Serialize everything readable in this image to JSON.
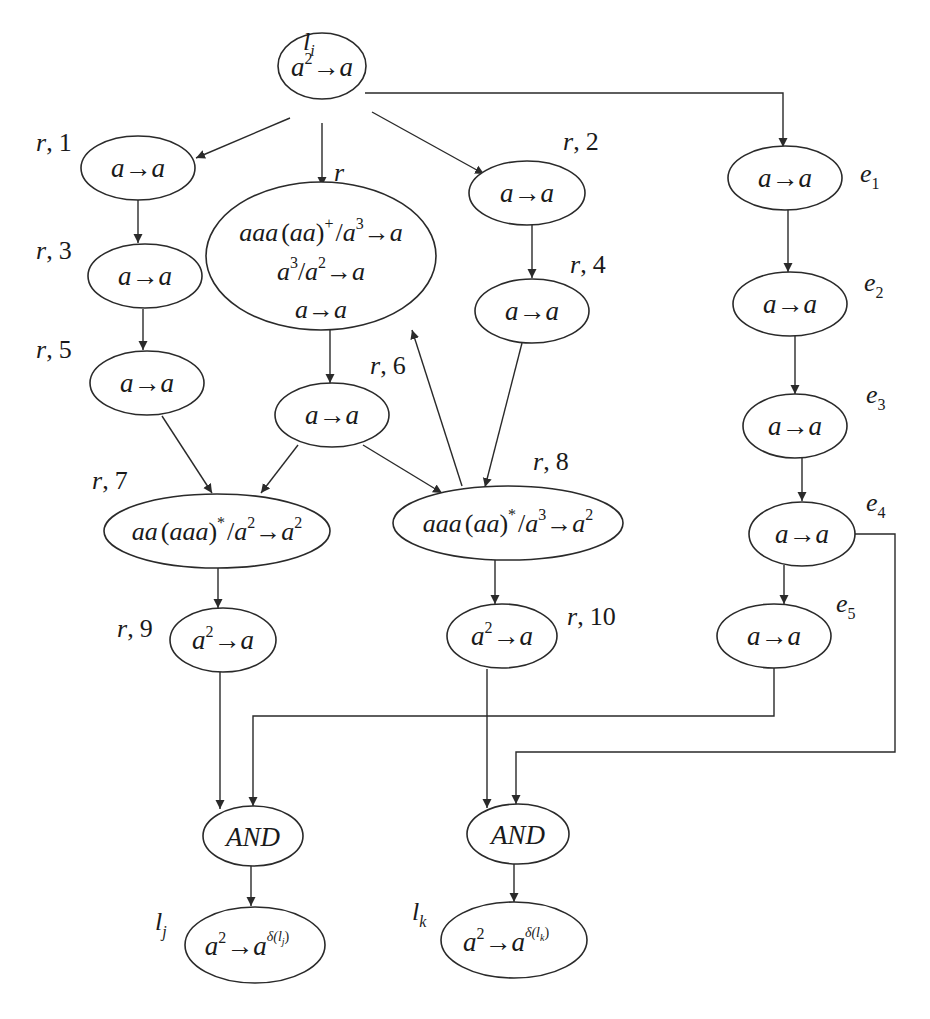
{
  "diagram": {
    "type": "spiking neural P system module diagram",
    "colors": {
      "stroke": "#2a2a2a",
      "text": "#1a1a1a",
      "background": "#ffffff"
    },
    "nodes": {
      "li": {
        "label": "l",
        "label_sub": "i",
        "rule_base": "a",
        "rule_exp": "2",
        "rule_arrow": "→",
        "rule_rhs": "a"
      },
      "r1": {
        "label": "r",
        "label_num": "1",
        "rule": "a→a"
      },
      "r": {
        "label": "r",
        "rules": [
          "aaa(aa)⁺/a³→a",
          "a³/a²→a",
          "a→a"
        ]
      },
      "r2": {
        "label": "r",
        "label_num": "2",
        "rule": "a→a"
      },
      "r3": {
        "label": "r",
        "label_num": "3",
        "rule": "a→a"
      },
      "r4": {
        "label": "r",
        "label_num": "4",
        "rule": "a→a"
      },
      "r5": {
        "label": "r",
        "label_num": "5",
        "rule": "a→a"
      },
      "r6": {
        "label": "r",
        "label_num": "6",
        "rule": "a→a"
      },
      "r7": {
        "label": "r",
        "label_num": "7",
        "rule": "aa(aaa)*/a²→a²"
      },
      "r8": {
        "label": "r",
        "label_num": "8",
        "rule": "aaa(aa)*/a³→a²"
      },
      "r9": {
        "label": "r",
        "label_num": "9",
        "rule": "a²→a"
      },
      "r10": {
        "label": "r",
        "label_num": "10",
        "rule": "a²→a"
      },
      "e1": {
        "label": "e",
        "label_sub": "1",
        "rule": "a→a"
      },
      "e2": {
        "label": "e",
        "label_sub": "2",
        "rule": "a→a"
      },
      "e3": {
        "label": "e",
        "label_sub": "3",
        "rule": "a→a"
      },
      "e4": {
        "label": "e",
        "label_sub": "4",
        "rule": "a→a"
      },
      "e5": {
        "label": "e",
        "label_sub": "5",
        "rule": "a→a"
      },
      "and1": {
        "rule": "AND"
      },
      "and2": {
        "rule": "AND"
      },
      "lj": {
        "label": "l",
        "label_sub": "j",
        "rule": "a²→a^δ(l_j)"
      },
      "lk": {
        "label": "l",
        "label_sub": "k",
        "rule": "a²→a^δ(l_k)"
      }
    },
    "separator": ",",
    "text": {
      "a": "a",
      "arrow": "→",
      "two": "2",
      "three": "3",
      "plus": "+",
      "star": "*",
      "slash": "/",
      "aaa": "aaa",
      "aa": "aa",
      "lparen": "(",
      "rparen": ")",
      "and": "AND",
      "delta_j": "δ(l",
      "delta_k": "δ(l",
      "j": "j",
      "k": "k",
      "close": ")"
    },
    "edges": [
      [
        "li",
        "r1"
      ],
      [
        "li",
        "r"
      ],
      [
        "li",
        "r2"
      ],
      [
        "li",
        "e1"
      ],
      [
        "r1",
        "r3"
      ],
      [
        "r3",
        "r5"
      ],
      [
        "r2",
        "r4"
      ],
      [
        "r",
        "r6"
      ],
      [
        "r5",
        "r7"
      ],
      [
        "r6",
        "r7"
      ],
      [
        "r6",
        "r8"
      ],
      [
        "r4",
        "r8"
      ],
      [
        "r8",
        "r"
      ],
      [
        "r7",
        "r9"
      ],
      [
        "r8",
        "r10"
      ],
      [
        "e1",
        "e2"
      ],
      [
        "e2",
        "e3"
      ],
      [
        "e3",
        "e4"
      ],
      [
        "e4",
        "e5"
      ],
      [
        "r9",
        "and1"
      ],
      [
        "e5",
        "and1"
      ],
      [
        "r10",
        "and2"
      ],
      [
        "e4",
        "and2"
      ],
      [
        "and1",
        "lj"
      ],
      [
        "and2",
        "lk"
      ]
    ]
  }
}
